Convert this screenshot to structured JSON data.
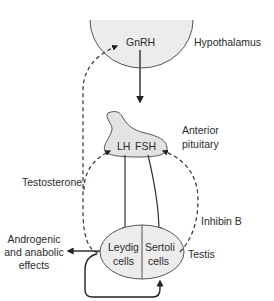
{
  "diagram": {
    "nodes": {
      "hypothalamus": {
        "label": "Hypothalamus",
        "hormone": "GnRH"
      },
      "pituitary": {
        "label_line1": "Anterior",
        "label_line2": "pituitary",
        "hormone_lh": "LH",
        "hormone_fsh": "FSH"
      },
      "testis": {
        "label": "Testis",
        "leydig_line1": "Leydig",
        "leydig_line2": "cells",
        "sertoli_line1": "Sertoli",
        "sertoli_line2": "cells"
      }
    },
    "feedback": {
      "testosterone": "Testosterone",
      "inhibin": "Inhibin B"
    },
    "effects": {
      "line1": "Androgenic",
      "line2": "and anabolic",
      "line3": "effects"
    },
    "colors": {
      "fill": "#ececec",
      "stroke": "#3a3a3a",
      "text": "#2b2b2b"
    }
  }
}
